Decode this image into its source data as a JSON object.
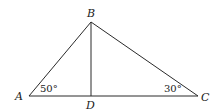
{
  "diagram": {
    "type": "triangle",
    "points": {
      "A": {
        "label": "A",
        "x": 29,
        "y": 96
      },
      "B": {
        "label": "B",
        "x": 91,
        "y": 22
      },
      "C": {
        "label": "C",
        "x": 198,
        "y": 96
      },
      "D": {
        "label": "D",
        "x": 91,
        "y": 96
      }
    },
    "segments": [
      "AB",
      "BC",
      "AC",
      "BD"
    ],
    "angles": {
      "A": {
        "label": "50°"
      },
      "C": {
        "label": "30°"
      }
    }
  }
}
